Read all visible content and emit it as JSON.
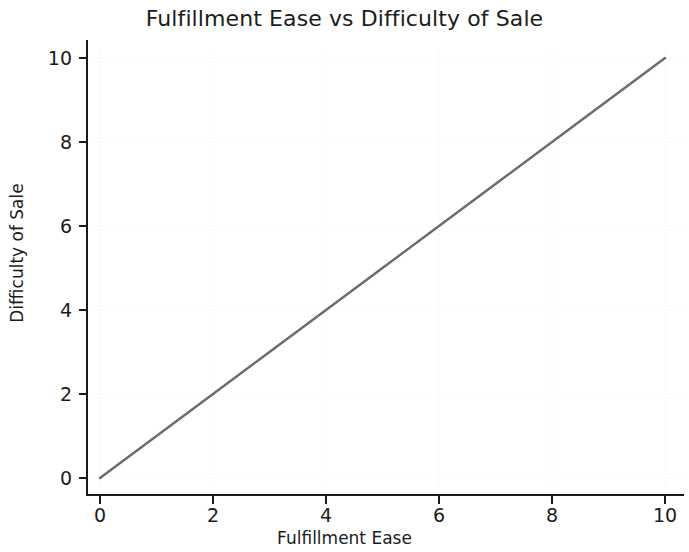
{
  "chart_data": {
    "type": "line",
    "title": "Fulfillment Ease vs Difficulty of Sale",
    "xlabel": "Fulfillment Ease",
    "ylabel": "Difficulty of Sale",
    "xlim": [
      -0.5,
      10.5
    ],
    "ylim": [
      -0.6,
      10.6
    ],
    "xticks": [
      0,
      2,
      4,
      6,
      8,
      10
    ],
    "yticks": [
      0,
      2,
      4,
      6,
      8,
      10
    ],
    "xtick_labels": [
      "0",
      "2",
      "4",
      "6",
      "8",
      "10"
    ],
    "ytick_labels": [
      "0",
      "2",
      "4",
      "6",
      "8",
      "10"
    ],
    "grid": true,
    "grid_style": "dotted",
    "grid_color": "#ededed",
    "legend": false,
    "series": [
      {
        "name": "Fulfillment Ease vs Difficulty of Sale",
        "color": "#6b6b6b",
        "linewidth": 2.4,
        "x": [
          0,
          1,
          2,
          3,
          4,
          5,
          6,
          7,
          8,
          9,
          10
        ],
        "values": [
          0,
          1,
          2,
          3,
          4,
          5,
          6,
          7,
          8,
          9,
          10
        ]
      }
    ],
    "background_color": "#ffffff",
    "axis_color": "#1a1a1a",
    "text_color": "#1c1c1c"
  }
}
